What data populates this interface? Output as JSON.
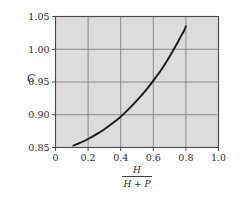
{
  "chart_data": {
    "type": "line",
    "title": "",
    "subtitle": "",
    "xlabel_numerator": "H",
    "xlabel_denominator": "H + P",
    "ylabel": "C",
    "xlim": [
      0,
      1.0
    ],
    "ylim": [
      0.85,
      1.05
    ],
    "xticks": [
      "0",
      "0.2",
      "0.4",
      "0.6",
      "0.8",
      "1.0"
    ],
    "xtick_values": [
      0,
      0.2,
      0.4,
      0.6,
      0.8,
      1.0
    ],
    "yticks": [
      "0.85",
      "0.90",
      "0.95",
      "1.00",
      "1.05"
    ],
    "ytick_values": [
      0.85,
      0.9,
      0.95,
      1.0,
      1.05
    ],
    "grid": true,
    "legend": "none",
    "plot_background": "#dcdcdc",
    "grid_color": "#808080",
    "axis_color": "#555555",
    "series": [
      {
        "name": "C vs H/(H+P)",
        "color": "#1a1a1a",
        "x": [
          0.11,
          0.15,
          0.2,
          0.25,
          0.3,
          0.35,
          0.4,
          0.45,
          0.5,
          0.55,
          0.6,
          0.65,
          0.7,
          0.74,
          0.77,
          0.79,
          0.8
        ],
        "y": [
          0.853,
          0.857,
          0.863,
          0.87,
          0.878,
          0.887,
          0.897,
          0.909,
          0.922,
          0.936,
          0.952,
          0.969,
          0.989,
          1.006,
          1.02,
          1.029,
          1.035
        ]
      }
    ]
  },
  "figure": {
    "background": "#ffffff"
  }
}
